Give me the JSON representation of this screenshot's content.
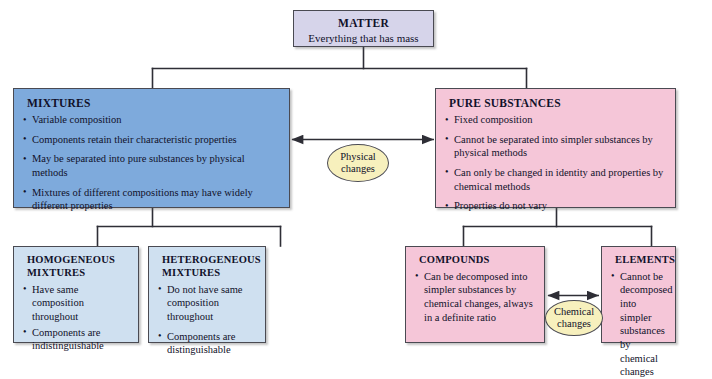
{
  "diagram": {
    "colors": {
      "matter_box": "#d6d4ea",
      "mixtures_box": "#7eaadc",
      "pure_substances_box": "#f5c6d8",
      "sub_mixtures_box": "#cfe0f0",
      "sub_pure_box": "#f5c6d8",
      "change_ellipse": "#f7f0bd",
      "line": "#2e2e36",
      "text": "#11112a"
    },
    "nodes": {
      "matter": {
        "title": "MATTER",
        "subtitle": "Everything that has mass"
      },
      "mixtures": {
        "title": "MIXTURES",
        "bullets": [
          "Variable composition",
          "Components retain their characteristic properties",
          "May be separated into pure substances by physical methods",
          "Mixtures of different compositions may have widely different properties"
        ]
      },
      "pure_substances": {
        "title": "PURE SUBSTANCES",
        "bullets": [
          "Fixed composition",
          "Cannot be separated into simpler substances by physical methods",
          "Can only be changed in identity and properties by chemical methods",
          "Properties do not vary"
        ]
      },
      "homogeneous_mixtures": {
        "title": "HOMOGENEOUS MIXTURES",
        "bullets": [
          "Have same composition throughout",
          "Components are indistinguishable"
        ]
      },
      "heterogeneous_mixtures": {
        "title": "HETEROGENEOUS MIXTURES",
        "bullets": [
          "Do not have same composition throughout",
          "Components are distinguishable"
        ]
      },
      "compounds": {
        "title": "COMPOUNDS",
        "bullets": [
          "Can be decomposed into simpler substances by chemical changes, always in a definite ratio"
        ]
      },
      "elements": {
        "title": "ELEMENTS",
        "bullets": [
          "Cannot be decomposed into simpler substances by chemical changes"
        ]
      }
    },
    "change_labels": {
      "physical": {
        "line1": "Physical",
        "line2": "changes"
      },
      "chemical": {
        "line1": "Chemical",
        "line2": "changes"
      }
    }
  }
}
